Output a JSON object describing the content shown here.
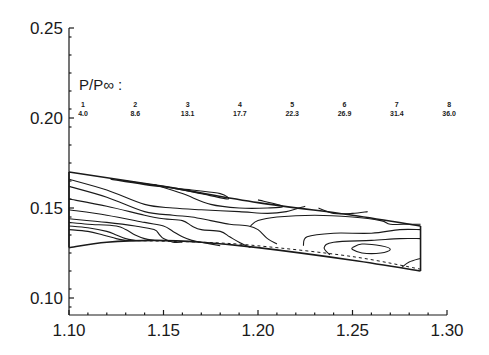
{
  "chart_data": {
    "type": "contour",
    "title": "",
    "xlabel": "",
    "ylabel": "",
    "xlim": [
      1.1,
      1.3
    ],
    "ylim": [
      0.09,
      0.25
    ],
    "x_ticks": [
      {
        "value": 1.1,
        "label": "1.10"
      },
      {
        "value": 1.15,
        "label": "1.15"
      },
      {
        "value": 1.2,
        "label": "1.20"
      },
      {
        "value": 1.25,
        "label": "1.25"
      },
      {
        "value": 1.3,
        "label": "1.30"
      }
    ],
    "y_ticks": [
      {
        "value": 0.1,
        "label": "0.10"
      },
      {
        "value": 0.15,
        "label": "0.15"
      },
      {
        "value": 0.2,
        "label": "0.20"
      },
      {
        "value": 0.25,
        "label": "0.25"
      }
    ],
    "grid": false,
    "legend": {
      "title": "P/P∞ :",
      "placement": "top",
      "levels": [
        {
          "index": "1",
          "value": "4.0"
        },
        {
          "index": "2",
          "value": "8.6"
        },
        {
          "index": "3",
          "value": "13.1"
        },
        {
          "index": "4",
          "value": "17.7"
        },
        {
          "index": "5",
          "value": "22.3"
        },
        {
          "index": "6",
          "value": "26.9"
        },
        {
          "index": "7",
          "value": "31.4"
        },
        {
          "index": "8",
          "value": "36.0"
        }
      ]
    },
    "domain": {
      "upper_wall": [
        [
          1.1,
          0.17
        ],
        [
          1.15,
          0.162
        ],
        [
          1.2,
          0.153
        ],
        [
          1.25,
          0.146
        ],
        [
          1.286,
          0.14
        ]
      ],
      "lower_wall": [
        [
          1.1,
          0.128
        ],
        [
          1.12,
          0.131
        ],
        [
          1.145,
          0.132
        ],
        [
          1.17,
          0.131
        ],
        [
          1.2,
          0.128
        ],
        [
          1.25,
          0.121
        ],
        [
          1.286,
          0.115
        ]
      ],
      "outlet_x": 1.286
    },
    "contours": [
      {
        "name": "contour-a",
        "points": [
          [
            1.122,
            0.166
          ],
          [
            1.14,
            0.163
          ],
          [
            1.165,
            0.16
          ],
          [
            1.18,
            0.158
          ],
          [
            1.184,
            0.155
          ],
          [
            1.17,
            0.158
          ],
          [
            1.15,
            0.162
          ],
          [
            1.13,
            0.165
          ],
          [
            1.122,
            0.166
          ]
        ]
      },
      {
        "name": "contour-b",
        "points": [
          [
            1.145,
            0.163
          ],
          [
            1.16,
            0.158
          ],
          [
            1.175,
            0.152
          ],
          [
            1.19,
            0.15
          ],
          [
            1.205,
            0.15
          ],
          [
            1.213,
            0.151
          ],
          [
            1.2,
            0.1545
          ]
        ]
      },
      {
        "name": "contour-c",
        "points": [
          [
            1.1,
            0.166
          ],
          [
            1.12,
            0.16
          ],
          [
            1.14,
            0.152
          ],
          [
            1.155,
            0.15
          ],
          [
            1.17,
            0.149
          ],
          [
            1.19,
            0.148
          ],
          [
            1.205,
            0.147
          ],
          [
            1.215,
            0.148
          ],
          [
            1.225,
            0.151
          ]
        ]
      },
      {
        "name": "contour-d",
        "points": [
          [
            1.1,
            0.162
          ],
          [
            1.12,
            0.156
          ],
          [
            1.14,
            0.148
          ],
          [
            1.155,
            0.146
          ],
          [
            1.165,
            0.145
          ],
          [
            1.175,
            0.143
          ],
          [
            1.185,
            0.141
          ],
          [
            1.195,
            0.14
          ],
          [
            1.2,
            0.138
          ],
          [
            1.205,
            0.133
          ],
          [
            1.21,
            0.13
          ]
        ]
      },
      {
        "name": "contour-e",
        "points": [
          [
            1.1,
            0.155
          ],
          [
            1.12,
            0.151
          ],
          [
            1.14,
            0.146
          ],
          [
            1.15,
            0.144
          ],
          [
            1.16,
            0.143
          ],
          [
            1.165,
            0.14
          ],
          [
            1.17,
            0.138
          ],
          [
            1.18,
            0.137
          ],
          [
            1.185,
            0.134
          ],
          [
            1.19,
            0.131
          ],
          [
            1.196,
            0.128
          ]
        ]
      },
      {
        "name": "contour-f",
        "points": [
          [
            1.1,
            0.149
          ],
          [
            1.12,
            0.146
          ],
          [
            1.14,
            0.142
          ],
          [
            1.15,
            0.14
          ],
          [
            1.155,
            0.137
          ],
          [
            1.16,
            0.134
          ],
          [
            1.165,
            0.132
          ],
          [
            1.17,
            0.131
          ],
          [
            1.18,
            0.129
          ]
        ]
      },
      {
        "name": "contour-g",
        "points": [
          [
            1.1,
            0.144
          ],
          [
            1.12,
            0.142
          ],
          [
            1.135,
            0.14
          ],
          [
            1.145,
            0.138
          ],
          [
            1.148,
            0.135
          ],
          [
            1.15,
            0.133
          ],
          [
            1.155,
            0.131
          ],
          [
            1.16,
            0.131
          ]
        ]
      },
      {
        "name": "contour-h",
        "points": [
          [
            1.1,
            0.142
          ],
          [
            1.11,
            0.141
          ],
          [
            1.125,
            0.14
          ],
          [
            1.13,
            0.138
          ],
          [
            1.135,
            0.135
          ],
          [
            1.14,
            0.133
          ],
          [
            1.145,
            0.132
          ]
        ]
      },
      {
        "name": "contour-i",
        "points": [
          [
            1.1,
            0.14
          ],
          [
            1.11,
            0.139
          ],
          [
            1.12,
            0.137
          ],
          [
            1.125,
            0.135
          ],
          [
            1.13,
            0.133
          ],
          [
            1.135,
            0.132
          ]
        ]
      },
      {
        "name": "contour-j",
        "points": [
          [
            1.1,
            0.138
          ],
          [
            1.11,
            0.137
          ],
          [
            1.118,
            0.135
          ],
          [
            1.125,
            0.133
          ],
          [
            1.13,
            0.132
          ]
        ]
      },
      {
        "name": "contour-k",
        "points": [
          [
            1.196,
            0.14
          ],
          [
            1.2,
            0.143
          ],
          [
            1.21,
            0.145
          ],
          [
            1.23,
            0.146
          ],
          [
            1.25,
            0.145
          ],
          [
            1.265,
            0.143
          ],
          [
            1.27,
            0.141
          ],
          [
            1.28,
            0.141
          ],
          [
            1.286,
            0.141
          ]
        ]
      },
      {
        "name": "contour-l",
        "points": [
          [
            1.232,
            0.15
          ],
          [
            1.24,
            0.147
          ],
          [
            1.25,
            0.147
          ],
          [
            1.258,
            0.148
          ]
        ]
      },
      {
        "name": "contour-m",
        "points": [
          [
            1.224,
            0.129
          ],
          [
            1.226,
            0.134
          ],
          [
            1.24,
            0.136
          ],
          [
            1.26,
            0.136
          ],
          [
            1.275,
            0.138
          ],
          [
            1.286,
            0.138
          ]
        ]
      },
      {
        "name": "contour-n",
        "points": [
          [
            1.238,
            0.124
          ],
          [
            1.235,
            0.128
          ],
          [
            1.24,
            0.131
          ],
          [
            1.26,
            0.132
          ],
          [
            1.275,
            0.133
          ],
          [
            1.286,
            0.133
          ]
        ]
      },
      {
        "name": "contour-o",
        "points": [
          [
            1.25,
            0.128
          ],
          [
            1.255,
            0.13
          ],
          [
            1.265,
            0.129
          ],
          [
            1.27,
            0.127
          ],
          [
            1.265,
            0.125
          ],
          [
            1.255,
            0.125
          ],
          [
            1.25,
            0.127
          ],
          [
            1.25,
            0.128
          ]
        ]
      },
      {
        "name": "contour-p",
        "points": [
          [
            1.276,
            0.117
          ],
          [
            1.28,
            0.12
          ],
          [
            1.286,
            0.122
          ]
        ]
      }
    ],
    "sonic_line": [
      [
        1.13,
        0.132
      ],
      [
        1.17,
        0.131
      ],
      [
        1.2,
        0.129
      ],
      [
        1.25,
        0.123
      ],
      [
        1.286,
        0.116
      ]
    ]
  }
}
